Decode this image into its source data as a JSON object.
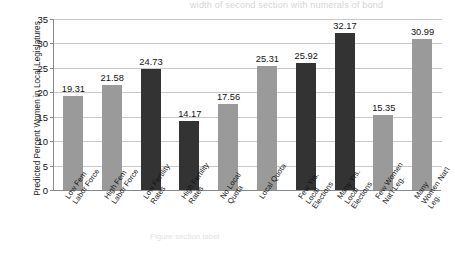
{
  "page": {
    "cut_off_header": "width of second section with numerals of bond",
    "faint_footer": "Figure section label"
  },
  "chart_data": {
    "type": "bar",
    "title": "",
    "xlabel": "",
    "ylabel": "Predicted Percent Women in Local Legislatures",
    "ylim": [
      0,
      35
    ],
    "ytick_step": 5,
    "yticks": [
      "0",
      "5",
      "10",
      "15",
      "20",
      "25",
      "30",
      "35"
    ],
    "grid": true,
    "legend": "none",
    "categories": [
      "Low Fem\nLabor Force",
      "High Fem\nLabor Force",
      "Low Fertility\nRates",
      "High Fertility\nRates",
      "No Local\nQuota",
      "Local Quota",
      "Few Yrs.\nLocal\nElections",
      "Many Yrs.\nLocal\nElections",
      "Few Women\nNat'l Leg.",
      "Many\nWomen Nat'l\nLeg."
    ],
    "values": [
      19.31,
      21.58,
      24.73,
      14.17,
      17.56,
      25.31,
      25.92,
      32.17,
      15.35,
      30.99
    ],
    "value_labels": [
      "19.31",
      "21.58",
      "24.73",
      "14.17",
      "17.56",
      "25.31",
      "25.92",
      "32.17",
      "15.35",
      "30.99"
    ],
    "bar_shades": [
      "light",
      "light",
      "dark",
      "dark",
      "light",
      "light",
      "dark",
      "dark",
      "light",
      "light"
    ],
    "colors": {
      "light_bar": "#9a9a9a",
      "dark_bar": "#333333",
      "gridline": "#c9c9c9",
      "axis": "#8a8a8a",
      "background": "#ffffff",
      "text": "#111111"
    }
  }
}
